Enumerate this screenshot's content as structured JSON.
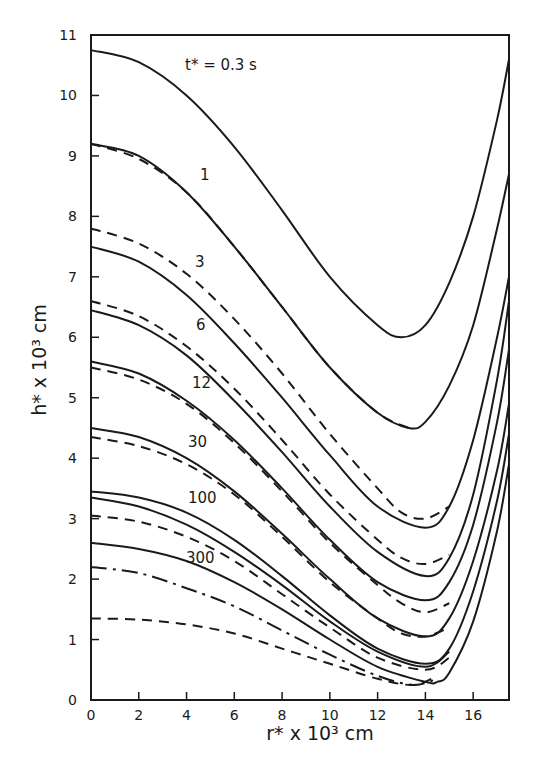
{
  "chart_data": {
    "type": "line",
    "title": "",
    "xlabel": "r* x 10^3 cm",
    "ylabel": "h* x 10^3 cm",
    "xlim": [
      0,
      17.5
    ],
    "ylim": [
      0,
      11
    ],
    "grid": false,
    "legend": "none (inline curve labels)",
    "x_ticks": [
      0,
      2,
      4,
      6,
      8,
      10,
      12,
      14,
      16
    ],
    "y_ticks": [
      0,
      1,
      2,
      3,
      4,
      5,
      6,
      7,
      8,
      9,
      10,
      11
    ],
    "annotations": [
      "t* = 0.3 s",
      "1",
      "3",
      "6",
      "12",
      "30",
      "100",
      "300"
    ],
    "series": [
      {
        "name": "t*=0.3 s (solid)",
        "style": "solid",
        "x": [
          0,
          2,
          4,
          6,
          8,
          10,
          12,
          13,
          14,
          15,
          16,
          17,
          17.5
        ],
        "values": [
          10.75,
          10.55,
          10.0,
          9.15,
          8.1,
          7.0,
          6.2,
          6.0,
          6.2,
          6.9,
          8.0,
          9.6,
          10.6
        ]
      },
      {
        "name": "t*=1 (solid)",
        "style": "solid",
        "x": [
          0,
          2,
          4,
          6,
          8,
          10,
          12,
          13.3,
          14,
          15,
          16,
          17,
          17.5
        ],
        "values": [
          9.2,
          9.0,
          8.4,
          7.5,
          6.5,
          5.5,
          4.75,
          4.5,
          4.6,
          5.2,
          6.2,
          7.8,
          8.7
        ]
      },
      {
        "name": "t*=1 (dashed)",
        "style": "dashed",
        "x": [
          0,
          2,
          4,
          6,
          8,
          10,
          12,
          13.3
        ],
        "values": [
          9.2,
          8.95,
          8.4,
          7.5,
          6.5,
          5.5,
          4.75,
          4.5
        ]
      },
      {
        "name": "t*=3 (dashed)",
        "style": "dashed",
        "x": [
          0,
          2,
          4,
          6,
          8,
          10,
          12,
          13,
          14,
          15
        ],
        "values": [
          7.8,
          7.55,
          7.05,
          6.3,
          5.4,
          4.4,
          3.5,
          3.1,
          3.0,
          3.2
        ]
      },
      {
        "name": "t*=3 (solid)",
        "style": "solid",
        "x": [
          0,
          2,
          4,
          6,
          8,
          10,
          12,
          14,
          15,
          16,
          17,
          17.5
        ],
        "values": [
          7.5,
          7.25,
          6.7,
          5.9,
          5.0,
          4.05,
          3.2,
          2.85,
          3.2,
          4.3,
          6.0,
          7.0
        ]
      },
      {
        "name": "t*=6 (dashed)",
        "style": "dashed",
        "x": [
          0,
          2,
          4,
          6,
          8,
          10,
          12,
          13,
          14,
          15
        ],
        "values": [
          6.6,
          6.35,
          5.85,
          5.15,
          4.3,
          3.4,
          2.65,
          2.35,
          2.25,
          2.4
        ]
      },
      {
        "name": "t*=6 (solid)",
        "style": "solid",
        "x": [
          0,
          2,
          4,
          6,
          8,
          10,
          12,
          14,
          15,
          16,
          17,
          17.5
        ],
        "values": [
          6.45,
          6.2,
          5.7,
          4.95,
          4.1,
          3.2,
          2.45,
          2.05,
          2.35,
          3.4,
          5.3,
          6.6
        ]
      },
      {
        "name": "t*=12 (solid)",
        "style": "solid",
        "x": [
          0,
          2,
          4,
          6,
          8,
          10,
          12,
          14,
          15,
          16,
          17,
          17.5
        ],
        "values": [
          5.6,
          5.4,
          4.95,
          4.3,
          3.5,
          2.65,
          1.95,
          1.65,
          1.95,
          2.9,
          4.6,
          5.8
        ]
      },
      {
        "name": "t*=12 (dashed)",
        "style": "dashed",
        "x": [
          0,
          2,
          4,
          6,
          8,
          10,
          12,
          13,
          14,
          15
        ],
        "values": [
          5.5,
          5.3,
          4.9,
          4.25,
          3.45,
          2.6,
          1.9,
          1.6,
          1.45,
          1.6
        ]
      },
      {
        "name": "t*=30 (solid)",
        "style": "solid",
        "x": [
          0,
          2,
          4,
          6,
          8,
          10,
          12,
          14,
          15,
          16,
          17,
          17.5
        ],
        "values": [
          4.5,
          4.35,
          4.0,
          3.45,
          2.75,
          2.0,
          1.35,
          1.05,
          1.35,
          2.3,
          3.8,
          4.9
        ]
      },
      {
        "name": "t*=30 (dashed)",
        "style": "dashed",
        "x": [
          0,
          2,
          4,
          6,
          8,
          10,
          12,
          13,
          14,
          15
        ],
        "values": [
          4.35,
          4.2,
          3.9,
          3.4,
          2.7,
          1.95,
          1.35,
          1.1,
          1.05,
          1.2
        ]
      },
      {
        "name": "t*=100 (solid)",
        "style": "solid",
        "x": [
          0,
          2,
          4,
          6,
          8,
          10,
          12,
          14,
          15,
          16,
          17,
          17.5
        ],
        "values": [
          3.45,
          3.35,
          3.1,
          2.65,
          2.05,
          1.4,
          0.85,
          0.6,
          0.85,
          1.8,
          3.3,
          4.4
        ]
      },
      {
        "name": "t*=100 (solid, lower)",
        "style": "solid",
        "x": [
          0,
          2,
          4,
          6,
          8,
          10,
          12,
          14,
          15
        ],
        "values": [
          3.35,
          3.2,
          2.9,
          2.45,
          1.9,
          1.3,
          0.8,
          0.55,
          0.8
        ]
      },
      {
        "name": "t*=100 (dashed)",
        "style": "dashed",
        "x": [
          0,
          2,
          4,
          6,
          8,
          10,
          12,
          14,
          15
        ],
        "values": [
          3.05,
          2.95,
          2.7,
          2.3,
          1.75,
          1.2,
          0.7,
          0.5,
          0.7
        ]
      },
      {
        "name": "t*=300 (solid)",
        "style": "solid",
        "x": [
          0,
          2,
          4,
          6,
          8,
          10,
          12,
          14,
          14.5,
          15,
          16,
          17,
          17.5
        ],
        "values": [
          2.6,
          2.5,
          2.3,
          1.95,
          1.5,
          1.0,
          0.55,
          0.3,
          0.3,
          0.45,
          1.3,
          2.8,
          3.9
        ]
      },
      {
        "name": "t*=300 (dash-dot)",
        "style": "dashdot",
        "x": [
          0,
          2,
          4,
          6,
          8,
          10,
          12,
          13.5,
          14.5
        ],
        "values": [
          2.2,
          2.1,
          1.85,
          1.55,
          1.15,
          0.75,
          0.4,
          0.25,
          0.35
        ]
      },
      {
        "name": "t*=300 (dashed)",
        "style": "dashed",
        "x": [
          0,
          2,
          4,
          6,
          8,
          10,
          12,
          13.5,
          14.5
        ],
        "values": [
          1.35,
          1.33,
          1.25,
          1.1,
          0.85,
          0.6,
          0.35,
          0.25,
          0.4
        ]
      }
    ]
  },
  "labels": {
    "y_axis": "h* x 10³ cm",
    "x_axis": "r* x 10³ cm",
    "curve_t03": "t* = 0.3 s",
    "curve_1": "1",
    "curve_3": "3",
    "curve_6": "6",
    "curve_12": "12",
    "curve_30": "30",
    "curve_100": "100",
    "curve_300": "300"
  }
}
